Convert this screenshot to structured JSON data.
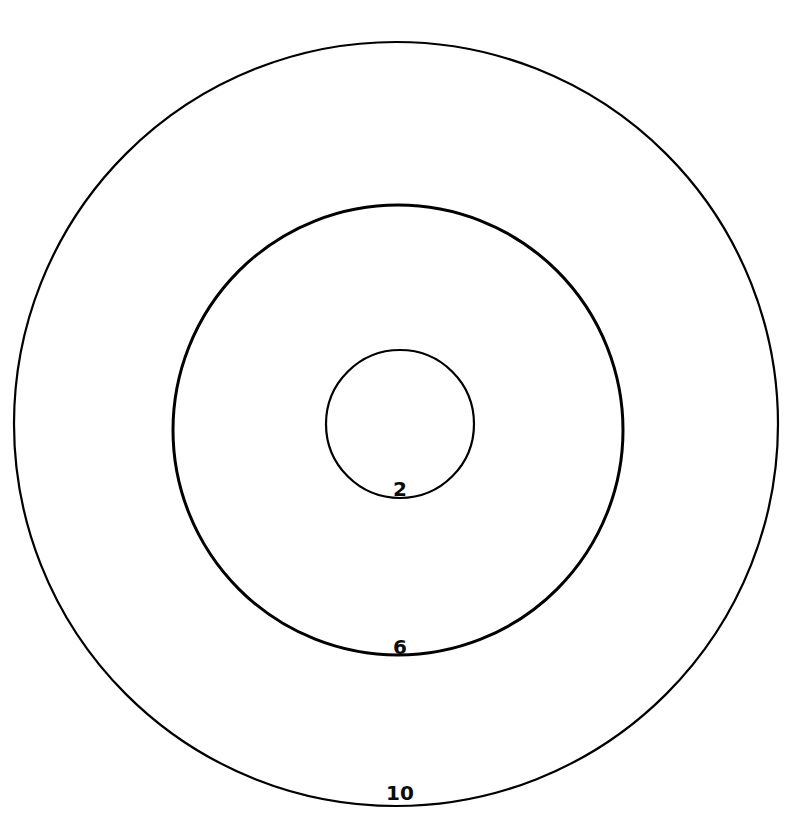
{
  "canvas": {
    "width": 791,
    "height": 838,
    "background_color": "#ffffff"
  },
  "diagram": {
    "stroke_color": "#000000",
    "label_color": "#0b0b0b"
  },
  "chart_data": {
    "type": "scatter",
    "title": "",
    "subtitle": "",
    "xlabel": "",
    "ylabel": "",
    "grid": false,
    "legend": null,
    "annotations": [
      "2",
      "6",
      "10"
    ],
    "series": [
      {
        "name": "circles",
        "values": [
          2,
          6,
          10
        ],
        "unit": "radius"
      }
    ],
    "circles": [
      {
        "label": "2",
        "radius_value": 2,
        "center_x": 400,
        "center_y": 424,
        "radius_px": 74,
        "stroke_width": 2.2,
        "label_x": 400,
        "label_y": 496
      },
      {
        "label": "6",
        "radius_value": 6,
        "center_x": 398,
        "center_y": 430,
        "radius_px": 225,
        "stroke_width": 3.0,
        "label_x": 400,
        "label_y": 654
      },
      {
        "label": "10",
        "radius_value": 10,
        "center_x": 396,
        "center_y": 424,
        "radius_px": 382,
        "stroke_width": 2.2,
        "label_x": 400,
        "label_y": 800
      }
    ]
  },
  "labels": {
    "inner": "2",
    "middle": "6",
    "outer": "10"
  },
  "typography": {
    "label_font_size_px": 20
  }
}
